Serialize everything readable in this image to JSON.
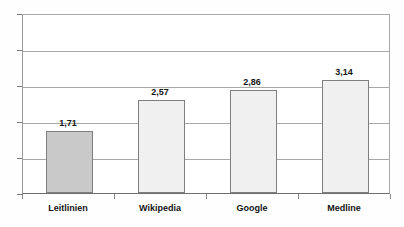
{
  "chart_data": {
    "type": "bar",
    "title": "",
    "subtitle": "",
    "xlabel": "",
    "ylabel": "",
    "categories": [
      "Leitlinien",
      "Wikipedia",
      "Google",
      "Medline"
    ],
    "values": [
      1.71,
      2.57,
      2.86,
      3.14
    ],
    "value_labels": [
      "1,71",
      "2,57",
      "2,86",
      "3,14"
    ],
    "ylim": [
      0,
      5
    ],
    "ytick_labels": [
      "0",
      "1",
      "2",
      "3",
      "4",
      "5"
    ],
    "ytick_values": [
      0,
      1,
      2,
      3,
      4,
      5
    ],
    "grid": true,
    "legend": false,
    "legend_position": "none",
    "bar_colors": [
      "#c9c9c9",
      "#f0f0f0",
      "#f0f0f0",
      "#f0f0f0"
    ],
    "bar_border_color": "#7f7f7f",
    "gridline_color": "#a8a8a8",
    "axis_color": "#6f6f6f",
    "text_color": "#141414",
    "background_color": "#ffffff"
  },
  "axes": {
    "y": {
      "ticks": [
        {
          "label": "5",
          "value": 5
        },
        {
          "label": "4",
          "value": 4
        },
        {
          "label": "3",
          "value": 3
        },
        {
          "label": "2",
          "value": 2
        },
        {
          "label": "1",
          "value": 1
        },
        {
          "label": "0",
          "value": 0
        }
      ]
    },
    "x": {
      "ticks": [
        {
          "label": "Leitlinien"
        },
        {
          "label": "Wikipedia"
        },
        {
          "label": "Google"
        },
        {
          "label": "Medline"
        }
      ]
    }
  },
  "bars": [
    {
      "category": "Leitlinien",
      "value": 1.71,
      "label": "1,71",
      "color": "#c9c9c9"
    },
    {
      "category": "Wikipedia",
      "value": 2.57,
      "label": "2,57",
      "color": "#f0f0f0"
    },
    {
      "category": "Google",
      "value": 2.86,
      "label": "2,86",
      "color": "#f0f0f0"
    },
    {
      "category": "Medline",
      "value": 3.14,
      "label": "3,14",
      "color": "#f0f0f0"
    }
  ]
}
